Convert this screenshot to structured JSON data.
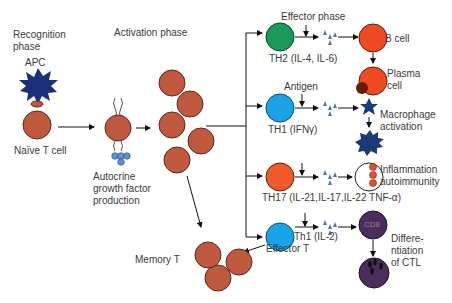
{
  "phases": {
    "recognition": "Recognition phase",
    "recognition_line1": "Recognition",
    "recognition_line2": "phase",
    "activation": "Activation phase",
    "effector": "Effector phase"
  },
  "cells": {
    "apc": "APC",
    "naive_t": "Naïve T cell",
    "autocrine_line1": "Autocrine",
    "autocrine_line2": "growth factor",
    "autocrine_line3": "production",
    "memory_t": "Memory T",
    "effector_t": "Effector T"
  },
  "branches": [
    {
      "id": "th2",
      "label": "TH2 (IL-4, IL-6)",
      "color": "#1a9a5a",
      "target": "B cell",
      "target2_line1": "Plasma",
      "target2_line2": "cell"
    },
    {
      "id": "th1",
      "label": "TH1 (IFNγ)",
      "color": "#1aa3e6",
      "input": "Antigen",
      "outcome_line1": "Macrophage",
      "outcome_line2": "activation"
    },
    {
      "id": "th17",
      "label": "TH17 (IL-21,IL-17,IL-22 TNF-α)",
      "color": "#f05a2a",
      "outcome_line1": "Inflammation",
      "outcome_line2": "autoimmunity"
    },
    {
      "id": "th1-il2",
      "label": "Th1 (IL-2)",
      "color": "#1aa3e6",
      "target": "CD8",
      "outcome_line1": "Differe-",
      "outcome_line2": "ntiation",
      "outcome_line3": "of CTL"
    }
  ],
  "colors": {
    "t_cell": "#c0583e",
    "apc": "#1c2f7a",
    "growth_factor": "#5b8fd6",
    "cytokine": "#4b7d99",
    "b_cell": "#f04a22",
    "cd8": "#4a2d5a",
    "macrophage": "#1c3a78"
  }
}
